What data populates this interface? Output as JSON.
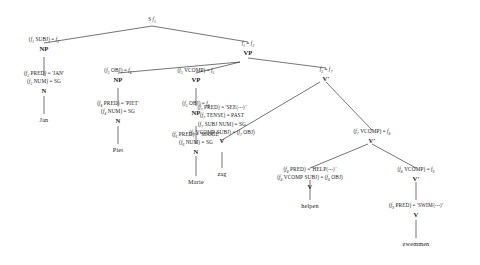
{
  "diagram": {
    "type": "lfg-c-structure-tree",
    "sentence": "Jan Piet Marie zag helpen zwemmen",
    "root": {
      "cat": "S",
      "index": "f₁"
    },
    "nodes": [
      {
        "id": "s",
        "cat": "S",
        "annotations": [],
        "index_label": "S f₁"
      },
      {
        "id": "np1",
        "cat": "NP",
        "annotations": [
          "(f₁ SUBJ) = f₂"
        ]
      },
      {
        "id": "n1",
        "cat": "N",
        "annotations": [
          "(f₂ PRED) = 'JAN'",
          "(f₂ NUM) = SG"
        ]
      },
      {
        "id": "w-jan",
        "cat": "",
        "word": "Jan"
      },
      {
        "id": "vp1",
        "cat": "VP",
        "annotations": [
          "f₁ = f₃"
        ]
      },
      {
        "id": "np2",
        "cat": "NP",
        "annotations": [
          "(f₃ OBJ) = f₄"
        ]
      },
      {
        "id": "n2",
        "cat": "N",
        "annotations": [
          "(f₄ PRED) = 'PIET'",
          "(f₄ NUM) = SG"
        ]
      },
      {
        "id": "w-piet",
        "cat": "",
        "word": "Piet"
      },
      {
        "id": "vp2",
        "cat": "VP",
        "annotations": [
          "(f₃ VCOMP) = f₅"
        ]
      },
      {
        "id": "np3",
        "cat": "NP",
        "annotations": [
          "(f₅ OBJ) = f₆"
        ]
      },
      {
        "id": "n3",
        "cat": "N",
        "annotations": [
          "(f₆ PRED) = 'MARIE'",
          "(f₆ NUM) = SG"
        ]
      },
      {
        "id": "w-marie",
        "cat": "",
        "word": "Marie"
      },
      {
        "id": "vbar1",
        "cat": "V′",
        "annotations": [
          "f₃ = f₇"
        ]
      },
      {
        "id": "v1",
        "cat": "V",
        "annotations": [
          "(f₇ PRED) = 'SEE⟨⋯⟩'",
          "(f₇ TENSE) = PAST",
          "(f₇ SUBJ NUM) = SG",
          "(f₇ VCOMP SUBJ) = (f₇ OBJ)"
        ]
      },
      {
        "id": "w-zag",
        "cat": "",
        "word": "zag"
      },
      {
        "id": "vbar2",
        "cat": "V′",
        "annotations": [
          "(f₇ VCOMP) = f₈"
        ]
      },
      {
        "id": "v2",
        "cat": "V",
        "annotations": [
          "(f₈ PRED) = 'HELP⟨⋯⟩'",
          "(f₈ VCOMP SUBJ) = (f₈ OBJ)"
        ]
      },
      {
        "id": "w-helpen",
        "cat": "",
        "word": "helpen"
      },
      {
        "id": "vbar3",
        "cat": "V′",
        "annotations": [
          "(f₈ VCOMP) = f₉"
        ]
      },
      {
        "id": "v3",
        "cat": "V",
        "annotations": [
          "(f₉ PRED) = 'SWIM⟨⋯⟩'"
        ]
      },
      {
        "id": "w-zwemmen",
        "cat": "",
        "word": "zwemmen"
      }
    ],
    "labels": {
      "root": "S f₁",
      "np1_eq": "(f₁ SUBJ) = f₂",
      "np1_cat": "NP",
      "n1_eq1": "(f₂ PRED) = 'JAN'",
      "n1_eq2": "(f₂ NUM) = SG",
      "n1_cat": "N",
      "w_jan": "Jan",
      "vp1_eq": "f₁ = f₃",
      "vp1_cat": "VP",
      "np2_eq": "(f₃ OBJ) = f₄",
      "np2_cat": "NP",
      "n2_eq1": "(f₄ PRED) = 'PIET'",
      "n2_eq2": "(f₄ NUM) = SG",
      "n2_cat": "N",
      "w_piet": "Piet",
      "vp2_eq": "(f₃ VCOMP) = f₅",
      "vp2_cat": "VP",
      "np3_eq": "(f₅ OBJ) = f₆",
      "np3_cat": "NP",
      "n3_eq1": "(f₆ PRED) = 'MARIE'",
      "n3_eq2": "(f₆ NUM) = SG",
      "n3_cat": "N",
      "w_marie": "Marie",
      "vbar1_eq": "f₃ = f₇",
      "vbar1_cat": "V′",
      "v1_eq1": "(f₇ PRED) = 'SEE⟨⋯⟩'",
      "v1_eq2": "(f₇ TENSE) = PAST",
      "v1_eq3": "(f₇ SUBJ NUM) = SG",
      "v1_eq4": "(f₇ VCOMP SUBJ) = (f₇ OBJ)",
      "v1_cat": "V",
      "w_zag": "zag",
      "vbar2_eq": "(f₇ VCOMP) = f₈",
      "vbar2_cat": "V′",
      "v2_eq1": "(f₈ PRED) = 'HELP⟨⋯⟩'",
      "v2_eq2": "(f₈ VCOMP SUBJ) = (f₈ OBJ)",
      "v2_cat": "V",
      "w_helpen": "helpen",
      "vbar3_eq": "(f₈ VCOMP) = f₉",
      "vbar3_cat": "V′",
      "v3_eq1": "(f₉ PRED) = 'SWIM⟨⋯⟩'",
      "v3_cat": "V",
      "w_zwemmen": "zwemmen"
    },
    "colors": {
      "ink": "#1a1a1a",
      "background": "#ffffff",
      "edge": "#1f1f1f"
    }
  }
}
